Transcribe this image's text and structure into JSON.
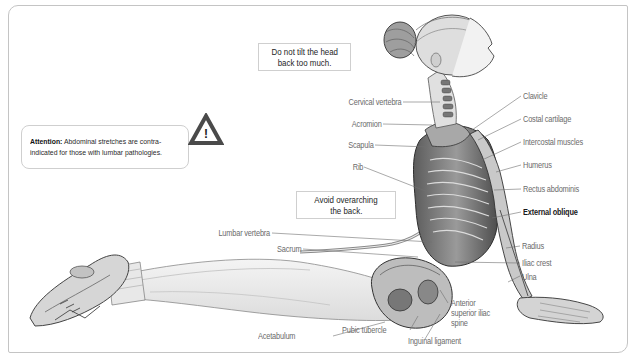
{
  "figure": {
    "frame_color": "#c4c4c4",
    "line_color": "#6b6b6b"
  },
  "callouts": {
    "head_warning": {
      "line1": "Do not tilt the head",
      "line2": "back too much."
    },
    "back_warning": {
      "line1": "Avoid overarching",
      "line2": "the back."
    },
    "attention": {
      "title": "Attention:",
      "line1_rest": " Abdominal stretches are contra-",
      "line2": "indicated for those with lumbar pathologies.",
      "icon": "warning-triangle-icon",
      "icon_glyph": "!"
    }
  },
  "labels_left": [
    {
      "id": "cervical-vertebra",
      "text": "Cervical vertebra"
    },
    {
      "id": "acromion",
      "text": "Acromion"
    },
    {
      "id": "scapula",
      "text": "Scapula"
    },
    {
      "id": "rib",
      "text": "Rib"
    },
    {
      "id": "lumbar-vertebra",
      "text": "Lumbar vertebra"
    },
    {
      "id": "sacrum",
      "text": "Sacrum"
    }
  ],
  "labels_right": [
    {
      "id": "clavicle",
      "text": "Clavicle"
    },
    {
      "id": "costal-cartilage",
      "text": "Costal cartilage"
    },
    {
      "id": "intercostal-muscles",
      "text": "Intercostal muscles"
    },
    {
      "id": "humerus",
      "text": "Humerus"
    },
    {
      "id": "rectus-abdominis",
      "text": "Rectus abdominis"
    },
    {
      "id": "external-oblique",
      "text": "External oblique",
      "emphasis": true
    },
    {
      "id": "radius",
      "text": "Radius"
    },
    {
      "id": "iliac-crest",
      "text": "Iliac crest"
    },
    {
      "id": "ulna",
      "text": "Ulna"
    }
  ],
  "labels_bottom": [
    {
      "id": "acetabulum",
      "text": "Acetabulum"
    },
    {
      "id": "pubic-tubercle",
      "text": "Pubic tubercle"
    },
    {
      "id": "inguinal-ligament",
      "text": "Inguinal ligament"
    },
    {
      "id": "anterior-superior-iliac-spine",
      "text": "Anterior\nsuperior iliac\nspine",
      "lines": [
        "Anterior",
        "superior iliac",
        "spine"
      ]
    }
  ]
}
